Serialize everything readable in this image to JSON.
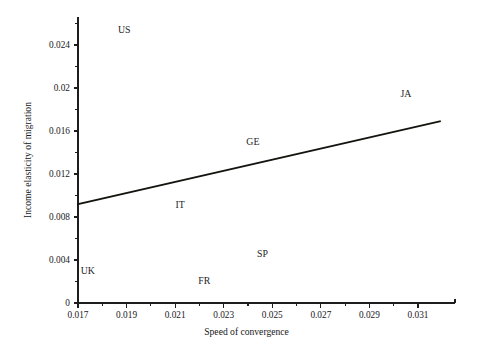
{
  "chart_data": {
    "type": "scatter",
    "title": "",
    "xlabel": "Speed of convergence",
    "ylabel": "Income elasticity of migration",
    "xlim": [
      0.017,
      0.0319
    ],
    "ylim": [
      0,
      0.0258
    ],
    "grid": false,
    "legend": "none",
    "x_ticks": [
      "0.017",
      "0.019",
      "0.021",
      "0.023",
      "0.025",
      "0.027",
      "0.029",
      "0.031"
    ],
    "x_tick_values": [
      0.017,
      0.019,
      0.021,
      0.023,
      0.025,
      0.027,
      0.029,
      0.031
    ],
    "x_minor_tick_values": [
      0.018,
      0.02,
      0.022,
      0.024,
      0.026,
      0.028,
      0.03
    ],
    "y_ticks": [
      "0",
      "0.004",
      "0.008",
      "0.012",
      "0.016",
      "0.02",
      "0.024"
    ],
    "y_tick_values": [
      0,
      0.004,
      0.008,
      0.012,
      0.016,
      0.02,
      0.024
    ],
    "y_minor_tick_values": [
      0.002,
      0.006,
      0.01,
      0.014,
      0.018,
      0.022,
      0.026
    ],
    "points": [
      {
        "label": "US",
        "x": 0.0189,
        "y": 0.0254
      },
      {
        "label": "JA",
        "x": 0.0305,
        "y": 0.0195
      },
      {
        "label": "GE",
        "x": 0.0242,
        "y": 0.015
      },
      {
        "label": "IT",
        "x": 0.0212,
        "y": 0.0092
      },
      {
        "label": "SP",
        "x": 0.0246,
        "y": 0.0046
      },
      {
        "label": "UK",
        "x": 0.0174,
        "y": 0.003
      },
      {
        "label": "FR",
        "x": 0.0222,
        "y": 0.0021
      }
    ],
    "trend_line": {
      "name": "fitted regression line",
      "x": [
        0.017,
        0.0319
      ],
      "y": [
        0.0092,
        0.0169
      ]
    },
    "colors": {
      "axis": "#1d1d1d",
      "line": "#14140f",
      "text": "#18181a",
      "background": "#ffffff"
    }
  }
}
